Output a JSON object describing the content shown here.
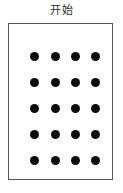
{
  "figure": {
    "title": "开始",
    "title_semantic": "start",
    "card": {
      "border_color": "#585858",
      "background_color": "#ffffff",
      "border_width_px": 1
    },
    "dots": {
      "color": "#0b0b0b",
      "shape": "circle",
      "diameter_px": 9,
      "total_count": 20,
      "rows": 5,
      "columns": 4,
      "row_centers_y": [
        32,
        58,
        84,
        110,
        136
      ],
      "column_centers_x": [
        25,
        46,
        66,
        86
      ],
      "grid": [
        [
          1,
          1,
          1,
          1
        ],
        [
          1,
          1,
          1,
          1
        ],
        [
          1,
          1,
          1,
          1
        ],
        [
          1,
          1,
          1,
          1
        ],
        [
          1,
          1,
          1,
          1
        ]
      ]
    }
  },
  "canvas": {
    "width_px": 123,
    "height_px": 193,
    "background_color": "#ffffff"
  }
}
